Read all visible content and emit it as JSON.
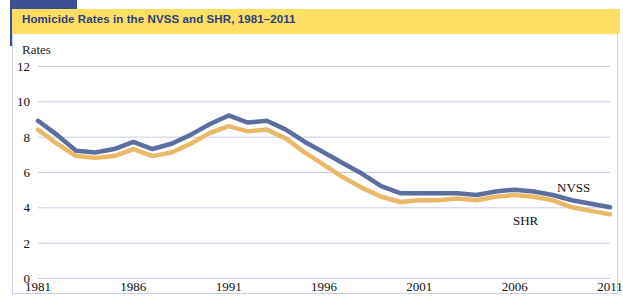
{
  "figure": {
    "title": "Homicide Rates in the NVSS and SHR, 1981–2011",
    "y_axis_title": "Rates",
    "title_band_color": "#fcde63",
    "title_text_color": "#2b3f82",
    "accent_block_color": "#3b4f94",
    "panel_border_color": "#c9cfe4",
    "gridline_color": "#c5c9e6"
  },
  "labels": {
    "nvss": "NVSS",
    "shr": "SHR"
  },
  "chart_data": {
    "type": "line",
    "title": "Homicide Rates in the NVSS and SHR, 1981–2011",
    "xlabel": "",
    "ylabel": "Rates",
    "xlim": [
      1981,
      2011
    ],
    "ylim": [
      0,
      12
    ],
    "yticks": [
      0,
      2,
      4,
      6,
      8,
      10,
      12
    ],
    "xticks": [
      1981,
      1986,
      1991,
      1996,
      2001,
      2006,
      2011
    ],
    "grid": true,
    "legend_position": "inline-right",
    "x": [
      1981,
      1982,
      1983,
      1984,
      1985,
      1986,
      1987,
      1988,
      1989,
      1990,
      1991,
      1992,
      1993,
      1994,
      1995,
      1996,
      1997,
      1998,
      1999,
      2000,
      2001,
      2002,
      2003,
      2004,
      2005,
      2006,
      2007,
      2008,
      2009,
      2010,
      2011
    ],
    "series": [
      {
        "name": "NVSS",
        "color": "#5b6e9e",
        "values": [
          8.9,
          8.1,
          7.2,
          7.1,
          7.3,
          7.7,
          7.3,
          7.6,
          8.1,
          8.7,
          9.2,
          8.8,
          8.9,
          8.4,
          7.7,
          7.1,
          6.5,
          5.9,
          5.2,
          4.8,
          4.8,
          4.8,
          4.8,
          4.7,
          4.9,
          5.0,
          4.9,
          4.7,
          4.4,
          4.2,
          4.0
        ]
      },
      {
        "name": "SHR",
        "color": "#e8b967",
        "values": [
          8.4,
          7.6,
          6.9,
          6.8,
          6.9,
          7.3,
          6.9,
          7.1,
          7.6,
          8.2,
          8.6,
          8.3,
          8.4,
          7.9,
          7.1,
          6.4,
          5.7,
          5.1,
          4.6,
          4.3,
          4.4,
          4.4,
          4.5,
          4.4,
          4.6,
          4.7,
          4.6,
          4.4,
          4.0,
          3.8,
          3.6
        ]
      }
    ],
    "annotations": [
      {
        "text": "NVSS",
        "x": 2007.0,
        "y": 6.0
      },
      {
        "text": "SHR",
        "x": 2004.0,
        "y": 3.0
      }
    ]
  }
}
